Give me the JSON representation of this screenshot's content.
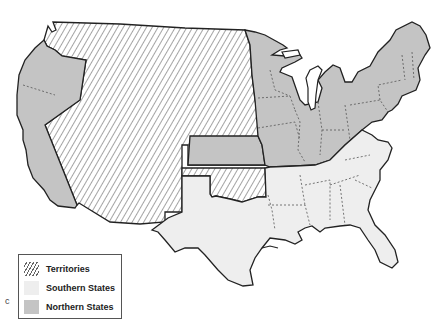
{
  "map": {
    "type": "US sectional map (c. 1850s-1860s)",
    "colors": {
      "territories_fill": "#ffffff",
      "territories_hatch": "#666666",
      "southern_fill": "#eeeeee",
      "northern_fill": "#c4c4c4",
      "border": "#222222",
      "state_line": "#555555"
    },
    "regions": [
      {
        "name": "Northern States",
        "includes": [
          "Pacific coast states",
          "Kansas",
          "Upper Midwest",
          "Northeast"
        ]
      },
      {
        "name": "Southern States",
        "includes": [
          "Texas",
          "Lower South",
          "Upper South"
        ]
      },
      {
        "name": "Territories",
        "includes": [
          "Western interior",
          "Indian Territory"
        ]
      }
    ]
  },
  "legend": {
    "items": [
      {
        "label": "Territories",
        "pattern": "hatched"
      },
      {
        "label": "Southern States",
        "color": "#eeeeee"
      },
      {
        "label": "Northern States",
        "color": "#c4c4c4"
      }
    ]
  },
  "stray_mark": "c"
}
